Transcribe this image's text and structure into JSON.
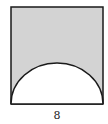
{
  "figure": {
    "shape": "square with semicircle removed from bottom edge",
    "shaded_region": "square minus semicircle",
    "side_label": "8",
    "colors": {
      "shade": "#d3d3d3",
      "stroke": "#1a1a1a",
      "background": "#ffffff"
    }
  }
}
